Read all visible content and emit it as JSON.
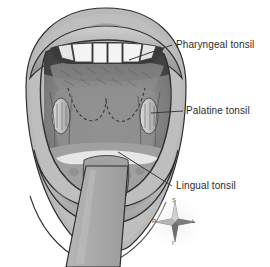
{
  "figure": {
    "background_color": "#ffffff",
    "line_color": "#2b2b2b",
    "labels": [
      {
        "id": "pharyngeal",
        "text": "Pharyngeal tonsil",
        "leader": "diagonal line from upper right of oral cavity to label"
      },
      {
        "id": "palatine",
        "text": "Palatine tonsil",
        "leader": "horizontal line from right palatine tonsil to label"
      },
      {
        "id": "lingual",
        "text": "Lingual tonsil",
        "leader": "diagonal line from base of tongue down-right to label"
      }
    ],
    "compass": {
      "name": "anatomical-orientation-compass",
      "superior": "S",
      "inferior": "I",
      "right": "R",
      "left": "L"
    },
    "anatomy": {
      "upper_lip": "upper lip",
      "lower_lip": "lower lip",
      "teeth": "upper incisors",
      "soft_palate": "soft palate with dashed pharyngeal tonsil outline",
      "palatine_tonsil_left": "palatine tonsil (viewer left)",
      "palatine_tonsil_right": "palatine tonsil (viewer right)",
      "tongue": "tongue",
      "tongue_depressor": "tongue depressor",
      "chin_contour": "chin and jaw contour lines"
    }
  }
}
